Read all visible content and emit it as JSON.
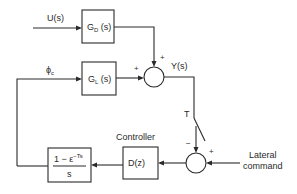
{
  "diagram": {
    "type": "block-diagram",
    "signals": {
      "disturbance_input": "U(s)",
      "commanded_bank": {
        "main": "ϕ",
        "sub": "c"
      },
      "output": "Y(s)",
      "sample_period": "T",
      "reference_line1": "Lateral",
      "reference_line2": "command"
    },
    "blocks": {
      "disturbance_tf": {
        "main": "G",
        "sub": "D",
        "suffix": " (s)"
      },
      "plant_tf": {
        "main": "G",
        "sub": "L",
        "suffix": " (s)"
      },
      "controller": {
        "label": "Controller",
        "tf": "D(z)"
      },
      "zoh": {
        "numerator_main": "1 − ε",
        "numerator_sup": "−Ts",
        "denominator": "s"
      }
    },
    "summing_junctions": {
      "output_sum": {
        "top_sign": "+",
        "left_sign": "+"
      },
      "error_sum": {
        "top_sign": "−",
        "right_sign": "+"
      }
    }
  }
}
